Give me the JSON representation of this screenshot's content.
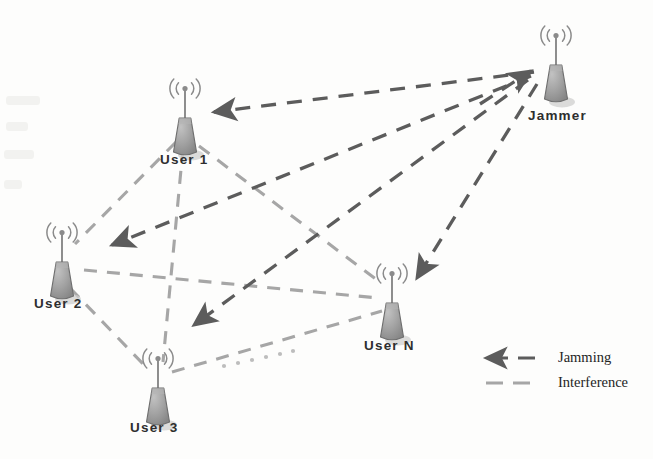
{
  "figure": {
    "kind": "network-diagram",
    "background_color": "#fdfdfc"
  },
  "colors": {
    "jamming": "#5c5c5c",
    "interference": "#a6a6a6",
    "tower_body": "#9a9a9a",
    "tower_outline": "#6f6f6f",
    "label_text": "#2e2e2e",
    "legend_text": "#242424",
    "ellipsis": "#b5b5b5"
  },
  "nodes": [
    {
      "id": "user1",
      "label": "User 1",
      "icon": "antenna-tower-icon",
      "x": 185,
      "y": 118,
      "label_x": 160,
      "label_y": 157
    },
    {
      "id": "user2",
      "label": "User 2",
      "icon": "antenna-tower-icon",
      "x": 62,
      "y": 262,
      "label_x": 34,
      "label_y": 300
    },
    {
      "id": "user3",
      "label": "User 3",
      "icon": "antenna-tower-icon",
      "x": 158,
      "y": 388,
      "label_x": 130,
      "label_y": 425
    },
    {
      "id": "userN",
      "label": "User N",
      "icon": "antenna-tower-icon",
      "x": 392,
      "y": 303,
      "label_x": 364,
      "label_y": 343
    },
    {
      "id": "jammer",
      "label": "Jammer",
      "icon": "antenna-tower-icon",
      "x": 556,
      "y": 65,
      "label_x": 528,
      "label_y": 113
    }
  ],
  "jamming_links": [
    {
      "from": "jammer",
      "to": "user1",
      "type": "jamming"
    },
    {
      "from": "jammer",
      "to": "user2",
      "type": "jamming"
    },
    {
      "from": "jammer",
      "to": "user3",
      "type": "jamming"
    },
    {
      "from": "jammer",
      "to": "userN",
      "type": "jamming"
    }
  ],
  "interference_links": [
    {
      "from": "user1",
      "to": "user2",
      "type": "interference"
    },
    {
      "from": "user1",
      "to": "user3",
      "type": "interference"
    },
    {
      "from": "user1",
      "to": "userN",
      "type": "interference"
    },
    {
      "from": "user2",
      "to": "user3",
      "type": "interference"
    },
    {
      "from": "user2",
      "to": "userN",
      "type": "interference"
    },
    {
      "from": "user3",
      "to": "userN",
      "type": "interference"
    }
  ],
  "ellipsis": {
    "label": "......",
    "between": [
      "user3",
      "userN"
    ]
  },
  "legend": {
    "position": "bottom-right",
    "items": [
      {
        "id": "legend-jamming",
        "label": "Jamming",
        "style": "dashed-arrow",
        "color": "#5c5c5c"
      },
      {
        "id": "legend-interference",
        "label": "Interference",
        "style": "dashed",
        "color": "#a6a6a6"
      }
    ]
  }
}
